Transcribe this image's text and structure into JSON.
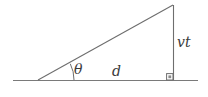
{
  "figure": {
    "kind": "geometry-diagram",
    "background_color": "#ffffff",
    "stroke_color": "#6e6e6e",
    "label_color": "#3a3a3a",
    "labels": {
      "angle": "θ",
      "base": "d",
      "height": "vt"
    },
    "geometry": {
      "baseline": {
        "x1": 13,
        "y1": 80,
        "x2": 198,
        "y2": 80
      },
      "left_vertex": {
        "x": 38,
        "y": 80
      },
      "apex": {
        "x": 173,
        "y": 5
      },
      "right_vertex": {
        "x": 173,
        "y": 80
      },
      "angle_arc_radius": 36,
      "right_angle_marker_size": 6
    }
  }
}
